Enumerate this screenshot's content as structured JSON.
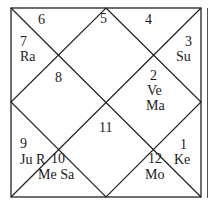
{
  "chart": {
    "style": "North Indian",
    "colors": {
      "line": "#222222",
      "text": "#1a1a1a",
      "background": "#ffffff"
    },
    "houses": [
      {
        "sign": "2",
        "planets": "Ve",
        "planets2": "Ma"
      },
      {
        "sign": "4",
        "planets": ""
      },
      {
        "sign": "3",
        "planets": "Su"
      },
      {
        "sign": "5",
        "planets": ""
      },
      {
        "sign": "6",
        "planets": ""
      },
      {
        "sign": "7",
        "planets": "Ra"
      },
      {
        "sign": "8",
        "planets": ""
      },
      {
        "sign": "11",
        "planets": ""
      },
      {
        "sign": "9",
        "planets": "Ju R"
      },
      {
        "sign": "10",
        "planets": "Me Sa"
      },
      {
        "sign": "12",
        "planets": "Mo"
      },
      {
        "sign": "1",
        "planets": "Ke"
      }
    ]
  }
}
